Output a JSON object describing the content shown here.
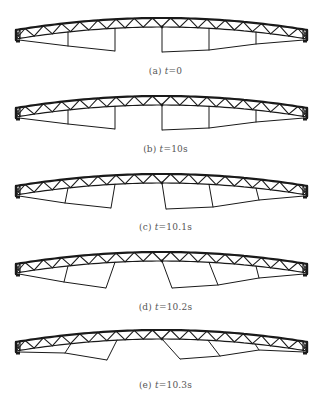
{
  "figure": {
    "stroke_color": "#1a1a1a",
    "caption_color": "#555555",
    "truss": {
      "x_left": 16,
      "x_right": 307,
      "top_end_y": 30,
      "top_mid_y": 18,
      "depth": 9,
      "bays": 32
    },
    "verticals_x": [
      68,
      115,
      162,
      209,
      256
    ],
    "panels": [
      {
        "id": "a",
        "top": 0,
        "label": "(a) t=0",
        "label_prefix": "(a) ",
        "label_var": "t",
        "label_value": "=0",
        "caption_y": 72,
        "struts": [
          {
            "top_x": 68,
            "bot_x": 68,
            "bot_y": 46
          },
          {
            "top_x": 115,
            "bot_x": 115,
            "bot_y": 51
          },
          {
            "top_x": 162,
            "bot_x": 162,
            "bot_y": 52
          },
          {
            "top_x": 209,
            "bot_x": 209,
            "bot_y": 50
          },
          {
            "top_x": 256,
            "bot_x": 256,
            "bot_y": 44
          }
        ]
      },
      {
        "id": "b",
        "top": 78,
        "label": "(b) t=10s",
        "label_prefix": "(b) ",
        "label_var": "t",
        "label_value": "=10s",
        "caption_y": 72,
        "struts": [
          {
            "top_x": 68,
            "bot_x": 68,
            "bot_y": 46
          },
          {
            "top_x": 115,
            "bot_x": 115,
            "bot_y": 51
          },
          {
            "top_x": 162,
            "bot_x": 162,
            "bot_y": 52
          },
          {
            "top_x": 209,
            "bot_x": 209,
            "bot_y": 50
          },
          {
            "top_x": 256,
            "bot_x": 256,
            "bot_y": 44
          }
        ]
      },
      {
        "id": "c",
        "top": 156,
        "label": "(c) t=10.1s",
        "label_prefix": "(c) ",
        "label_var": "t",
        "label_value": "=10.1s",
        "caption_y": 72,
        "struts": [
          {
            "top_x": 68,
            "bot_x": 65,
            "bot_y": 47
          },
          {
            "top_x": 115,
            "bot_x": 111,
            "bot_y": 52
          },
          {
            "top_x": 162,
            "bot_x": 166,
            "bot_y": 53
          },
          {
            "top_x": 209,
            "bot_x": 213,
            "bot_y": 51
          },
          {
            "top_x": 256,
            "bot_x": 259,
            "bot_y": 44
          }
        ]
      },
      {
        "id": "d",
        "top": 234,
        "label": "(d) t=10.2s",
        "label_prefix": "(d) ",
        "label_var": "t",
        "label_value": "=10.2s",
        "caption_y": 74,
        "struts": [
          {
            "top_x": 68,
            "bot_x": 64,
            "bot_y": 48
          },
          {
            "top_x": 115,
            "bot_x": 106,
            "bot_y": 54
          },
          {
            "top_x": 162,
            "bot_x": 172,
            "bot_y": 54
          },
          {
            "top_x": 209,
            "bot_x": 218,
            "bot_y": 51
          },
          {
            "top_x": 256,
            "bot_x": 259,
            "bot_y": 44
          }
        ]
      },
      {
        "id": "e",
        "top": 312,
        "label": "(e) t=10.3s",
        "label_prefix": "(e) ",
        "label_var": "t",
        "label_value": "=10.3s",
        "caption_y": 74,
        "struts": [
          {
            "top_x": 71,
            "bot_x": 65,
            "bot_y": 41
          },
          {
            "top_x": 117,
            "bot_x": 107,
            "bot_y": 48
          },
          {
            "top_x": 162,
            "bot_x": 180,
            "bot_y": 47
          },
          {
            "top_x": 208,
            "bot_x": 220,
            "bot_y": 44
          },
          {
            "top_x": 255,
            "bot_x": 259,
            "bot_y": 38
          }
        ]
      }
    ]
  }
}
